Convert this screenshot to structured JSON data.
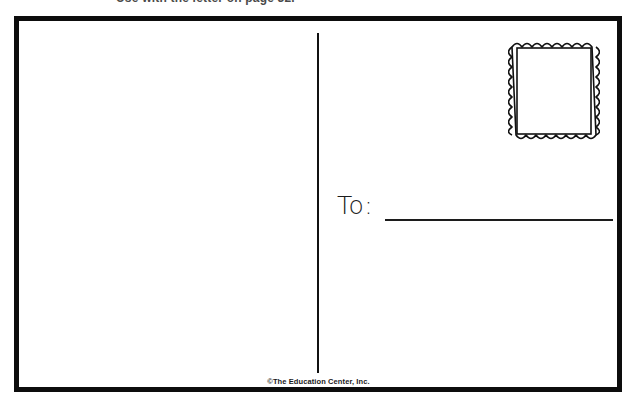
{
  "page": {
    "width": 637,
    "height": 407,
    "background_color": "#ffffff"
  },
  "header_fragment": {
    "text": "Use with the letter on page 32.",
    "note": "clipped at top edge of image, only descenders visible"
  },
  "postcard": {
    "border_color": "#0d0d0d",
    "border_width_px": 5,
    "background_color": "#ffffff",
    "divider": {
      "orientation": "vertical",
      "color": "#111111"
    },
    "message_area": {
      "label": "message-area",
      "content": ""
    },
    "address_area": {
      "to_label": "To:",
      "to_line_value": "",
      "stamp": {
        "label": "postage-stamp",
        "style": "perforated-outline",
        "scallops_horizontal": 9,
        "scallops_vertical": 10,
        "stroke_color": "#111111",
        "fill_color": "#ffffff"
      }
    }
  },
  "credit": {
    "text": "©The Education Center, Inc."
  }
}
